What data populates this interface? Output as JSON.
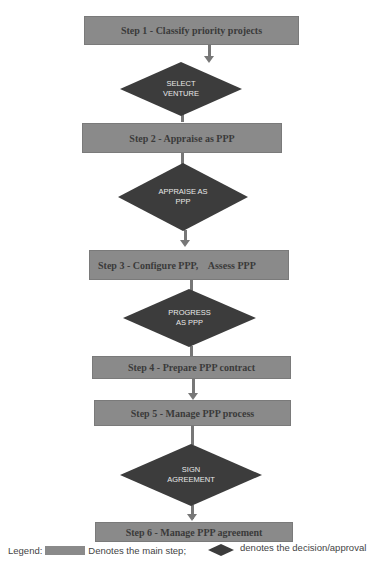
{
  "steps": [
    {
      "label": "Step 1 - Classify priority projects"
    },
    {
      "label": "Step 2 - Appraise as PPP"
    },
    {
      "label": "Step 3 - Configure PPP,    Assess PPP"
    },
    {
      "label": "Step 4 - Prepare PPP contract"
    },
    {
      "label": "Step 5 - Manage PPP process"
    },
    {
      "label": "Step 6 - Manage PPP agreement"
    }
  ],
  "decisions": [
    {
      "label": "SELECT\nVENTURE"
    },
    {
      "label": "APPRAISE AS\nPPP"
    },
    {
      "label": "PROGRESS\nAS PPP"
    },
    {
      "label": "SIGN\nAGREEMENT"
    }
  ],
  "legend": {
    "prefix": "Legend:",
    "step_text": "Denotes the main step;",
    "decision_text": "denotes the decision/approval"
  },
  "colors": {
    "step_fill": "#8a8a8a",
    "diamond_fill": "#3c3c3c",
    "connector": "#777777"
  }
}
